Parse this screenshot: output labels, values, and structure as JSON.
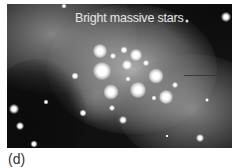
{
  "figure": {
    "caption": "Bright massive stars",
    "panel_label": "(d)",
    "pointer_arrow": "line-pointer",
    "colors": {
      "sky": "#111111",
      "nebula": "#bdbdbd",
      "text": "#e6e6e6",
      "panel_label": "#333333"
    }
  }
}
